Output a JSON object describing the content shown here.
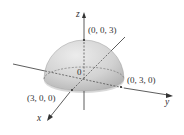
{
  "figure": {
    "type": "3d-axes-hemisphere",
    "surface": "upper hemisphere of radius 3",
    "axes": {
      "x": {
        "label": "x"
      },
      "y": {
        "label": "y"
      },
      "z": {
        "label": "z"
      }
    },
    "origin_label": "0",
    "points": [
      {
        "id": "top",
        "label": "(0, 0, 3)"
      },
      {
        "id": "y-intercept",
        "label": "(0, 3, 0)"
      },
      {
        "id": "x-intercept",
        "label": "(3, 0, 0)"
      }
    ],
    "colors": {
      "surface_light": "#e6e6e6",
      "surface_dark": "#b3b3b3",
      "axis": "#333333",
      "hidden_axis": "#555555"
    }
  }
}
